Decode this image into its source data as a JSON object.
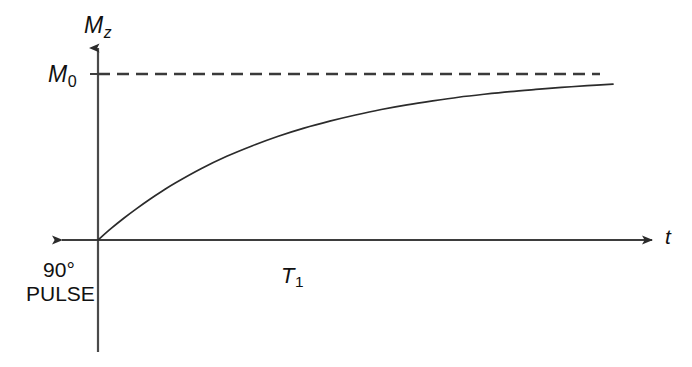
{
  "figure": {
    "background_color": "#ffffff",
    "line_color": "#2b2b2b",
    "text_color": "#111111"
  },
  "axes": {
    "y_axis": {
      "label": "M",
      "label_subscript": "z",
      "name": "Mz",
      "arrow": "up"
    },
    "x_axis": {
      "label": "t",
      "name": "time",
      "arrow_right": "right",
      "arrow_left": "left"
    }
  },
  "annotations": {
    "asymptote": {
      "label": "M",
      "label_subscript": "0",
      "name": "M0",
      "style": "dashed",
      "value": 1.0
    },
    "time_constant": {
      "label": "T",
      "label_subscript": "1",
      "name": "T1"
    },
    "pulse": {
      "line1": "90°",
      "line2": "PULSE"
    }
  },
  "chart_data": {
    "type": "line",
    "title": "",
    "xlabel": "t",
    "ylabel": "Mz",
    "grid": false,
    "legend": null,
    "xlim": [
      0,
      2.8
    ],
    "ylim": [
      0,
      1.12
    ],
    "asymptote_y": 1.0,
    "equation": "Mz = M0 (1 - exp(-t / T1))",
    "series": [
      {
        "name": "longitudinal magnetization recovery",
        "style": "solid",
        "x": [
          0.0,
          0.07,
          0.14,
          0.21,
          0.28,
          0.35,
          0.42,
          0.56,
          0.7,
          0.84,
          0.98,
          1.12,
          1.26,
          1.4,
          1.54,
          1.68,
          1.82,
          1.96,
          2.1,
          2.24,
          2.38,
          2.52,
          2.66,
          2.8
        ],
        "y": [
          0.0,
          0.068,
          0.131,
          0.189,
          0.244,
          0.295,
          0.343,
          0.429,
          0.504,
          0.568,
          0.625,
          0.674,
          0.716,
          0.753,
          0.786,
          0.814,
          0.838,
          0.86,
          0.878,
          0.894,
          0.907,
          0.919,
          0.93,
          0.939
        ]
      },
      {
        "name": "M0 equilibrium asymptote",
        "style": "dashed",
        "x": [
          0.0,
          2.74
        ],
        "y": [
          1.0,
          1.0
        ]
      }
    ]
  }
}
